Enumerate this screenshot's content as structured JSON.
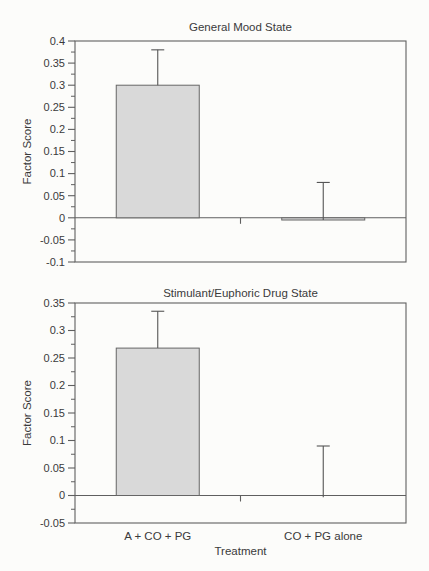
{
  "colors": {
    "background": "#fcfcfa",
    "ink": "#3a3a3a",
    "line": "#5f5f5f",
    "bar_fill": "#d9d9d9",
    "bar_stroke": "#666666",
    "error_stroke": "#555555"
  },
  "chart_data": [
    {
      "type": "bar",
      "title": "General Mood State",
      "ylabel": "Factor Score",
      "xlabel": "",
      "categories": [
        "A + CO + PG",
        "CO + PG alone"
      ],
      "show_category_labels": false,
      "values": [
        0.3,
        -0.005
      ],
      "error_upper": [
        0.38,
        0.08
      ],
      "ylim": [
        -0.1,
        0.4
      ],
      "ytick_interval": 0.05,
      "ytick_labels": [
        "0.4",
        "0.35",
        "0.3",
        "0.25",
        "0.2",
        "0.15",
        "0.1",
        "0.05",
        "0",
        "-0.05",
        "-0.1"
      ],
      "minor_ticks": true,
      "grid": false,
      "legend": "none",
      "error_bars": "upper-only",
      "axis_frame": "box",
      "baseline_at_zero": true
    },
    {
      "type": "bar",
      "title": "Stimulant/Euphoric Drug State",
      "ylabel": "Factor Score",
      "xlabel": "Treatment",
      "categories": [
        "A + CO + PG",
        "CO + PG alone"
      ],
      "show_category_labels": true,
      "values": [
        0.268,
        -0.003
      ],
      "error_upper": [
        0.335,
        0.09
      ],
      "ylim": [
        -0.05,
        0.35
      ],
      "ytick_interval": 0.05,
      "ytick_labels": [
        "0.35",
        "0.3",
        "0.25",
        "0.2",
        "0.15",
        "0.1",
        "0.05",
        "0",
        "-0.05"
      ],
      "minor_ticks": true,
      "grid": false,
      "legend": "none",
      "error_bars": "upper-only",
      "axis_frame": "box",
      "baseline_at_zero": true
    }
  ]
}
